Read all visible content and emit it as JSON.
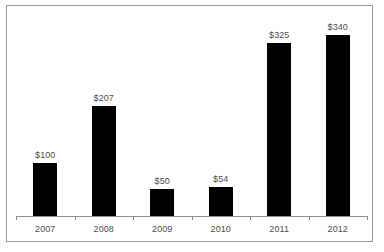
{
  "chart_data": {
    "type": "bar",
    "title": "",
    "subtitle": "",
    "xlabel": "",
    "ylabel": "",
    "categories": [
      "2007",
      "2008",
      "2009",
      "2010",
      "2011",
      "2012"
    ],
    "values": [
      100,
      207,
      50,
      54,
      325,
      340
    ],
    "value_labels": [
      "$100",
      "$207",
      "$50",
      "$54",
      "$325",
      "$340"
    ],
    "series": [
      {
        "name": "",
        "values": [
          100,
          207,
          50,
          54,
          325,
          340
        ]
      }
    ],
    "ylim": [
      0,
      379
    ],
    "grid": false,
    "legend": false,
    "y_axis_visible": false,
    "x_axis_visible": true,
    "bar_color": "#000000",
    "axis_color": "#8c8c8c",
    "label_color": "#4d4d4d",
    "frame_color": "#9a9a9a",
    "background_color": "#ffffff"
  }
}
